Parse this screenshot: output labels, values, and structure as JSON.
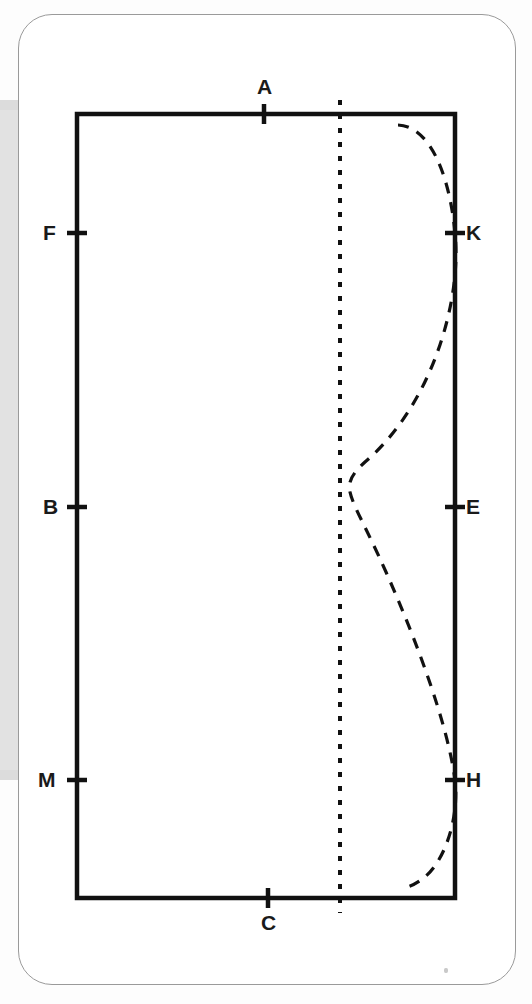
{
  "document": {
    "type": "geometry-diagram",
    "description": "Rectangle with labelled tick marks and a dashed sinusoidal curve"
  },
  "card": {
    "background_color": "#ffffff",
    "border_color": "#9a9a9a",
    "shadow_color": "#e2e2e2"
  },
  "figure": {
    "stroke_color": "#111111",
    "rectangle": {
      "left": 77,
      "right": 455,
      "top": 114,
      "bottom": 898,
      "stroke_width": 4.5
    },
    "axis_line": {
      "name": "dashed-vertical-axis",
      "x": 340,
      "y_start": 100,
      "y_end": 913,
      "dash": "5 9",
      "stroke_width": 4
    },
    "curve": {
      "name": "dashed-wave-curve",
      "dash": "11 9",
      "stroke_width": 3.2,
      "path": "M 398 125 C 428 126 449 170 455 233 C 462 300 432 405 365 462 C 352 474 348 481 350 492 C 353 506 366 527 386 572 C 418 644 448 726 455 780 C 459 812 448 856 426 876 C 418 883 410 887 403 888"
    },
    "ticks": [
      {
        "label": "A",
        "name": "tick-a",
        "side": "top",
        "x": 264,
        "y": 114,
        "label_x": 257,
        "label_y": 76
      },
      {
        "label": "C",
        "name": "tick-c",
        "side": "bottom",
        "x": 268,
        "y": 898,
        "label_x": 261,
        "label_y": 912
      },
      {
        "label": "F",
        "name": "tick-f",
        "side": "left",
        "x": 77,
        "y": 233,
        "label_x": 43,
        "label_y": 222
      },
      {
        "label": "B",
        "name": "tick-b",
        "side": "left",
        "x": 77,
        "y": 507,
        "label_x": 43,
        "label_y": 496
      },
      {
        "label": "M",
        "name": "tick-m",
        "side": "left",
        "x": 77,
        "y": 780,
        "label_x": 38,
        "label_y": 769
      },
      {
        "label": "K",
        "name": "tick-k",
        "side": "right",
        "x": 455,
        "y": 233,
        "label_x": 466,
        "label_y": 222
      },
      {
        "label": "E",
        "name": "tick-e",
        "side": "right",
        "x": 455,
        "y": 507,
        "label_x": 466,
        "label_y": 496
      },
      {
        "label": "H",
        "name": "tick-h",
        "side": "right",
        "x": 455,
        "y": 780,
        "label_x": 466,
        "label_y": 769
      }
    ]
  },
  "chart_data": {
    "type": "line",
    "title": "",
    "xlabel": "",
    "ylabel": "",
    "grid": false,
    "legend": null,
    "annotations": [
      "A",
      "C",
      "F",
      "B",
      "M",
      "K",
      "E",
      "H"
    ],
    "series": [
      {
        "name": "dashed-wave-curve",
        "style": "dashed",
        "points": [
          [
            398,
            125
          ],
          [
            421,
            132
          ],
          [
            440,
            158
          ],
          [
            452,
            196
          ],
          [
            455,
            233
          ],
          [
            458,
            282
          ],
          [
            447,
            340
          ],
          [
            420,
            400
          ],
          [
            385,
            440
          ],
          [
            360,
            468
          ],
          [
            350,
            486
          ],
          [
            352,
            500
          ],
          [
            368,
            532
          ],
          [
            392,
            585
          ],
          [
            420,
            650
          ],
          [
            442,
            715
          ],
          [
            455,
            780
          ],
          [
            459,
            820
          ],
          [
            448,
            858
          ],
          [
            426,
            876
          ],
          [
            403,
            888
          ]
        ]
      },
      {
        "name": "dashed-vertical-axis",
        "style": "dashed",
        "points": [
          [
            340,
            100
          ],
          [
            340,
            913
          ]
        ]
      },
      {
        "name": "rectangle-outline",
        "style": "solid",
        "points": [
          [
            77,
            114
          ],
          [
            455,
            114
          ],
          [
            455,
            898
          ],
          [
            77,
            898
          ],
          [
            77,
            114
          ]
        ]
      }
    ]
  }
}
